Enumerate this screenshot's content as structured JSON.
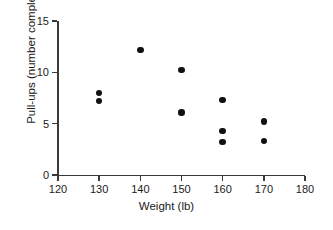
{
  "chart_data": {
    "type": "scatter",
    "title": "",
    "xlabel": "Weight (lb)",
    "ylabel": "Pull-ups (number completed)",
    "xlim": [
      120,
      180
    ],
    "ylim": [
      0,
      15
    ],
    "xticks": [
      120,
      130,
      140,
      150,
      160,
      170,
      180
    ],
    "yticks": [
      0,
      5,
      10,
      15
    ],
    "xtick_labels": [
      "120",
      "130",
      "140",
      "150",
      "160",
      "170",
      "180"
    ],
    "ytick_labels": [
      "0",
      "5",
      "10",
      "15"
    ],
    "grid": false,
    "legend": false,
    "marker": "filled-circle",
    "marker_color": "#111111",
    "axis_color": "#3a3a3a",
    "background": "#ffffff",
    "points": [
      {
        "x": 130,
        "y": 8.0
      },
      {
        "x": 130,
        "y": 7.2
      },
      {
        "x": 140,
        "y": 12.2
      },
      {
        "x": 150,
        "y": 10.2
      },
      {
        "x": 150,
        "y": 6.1
      },
      {
        "x": 160,
        "y": 7.3
      },
      {
        "x": 160,
        "y": 4.3
      },
      {
        "x": 160,
        "y": 3.2
      },
      {
        "x": 170,
        "y": 5.2
      },
      {
        "x": 170,
        "y": 3.3
      }
    ]
  }
}
